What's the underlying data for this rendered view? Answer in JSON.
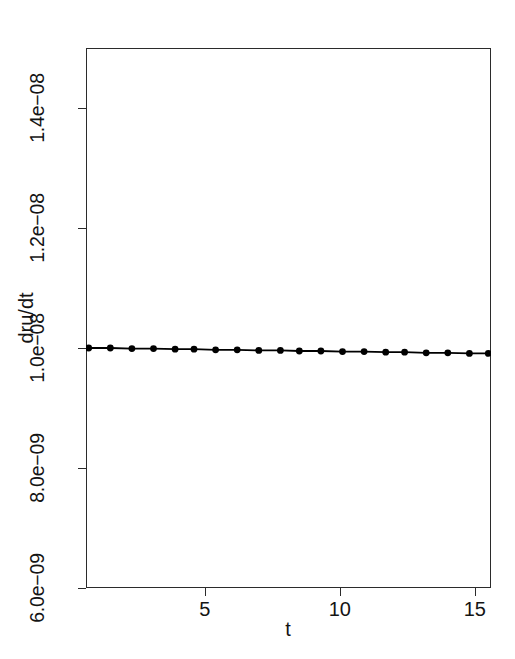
{
  "chart_data": {
    "type": "line",
    "title": "",
    "subtitle": "",
    "xlabel": "t",
    "ylabel": "dru/dt",
    "xlim": [
      0.6,
      15.6
    ],
    "ylim": [
      6e-09,
      1.5e-08
    ],
    "grid": false,
    "legend": null,
    "series": [
      {
        "name": "dru/dt",
        "marker": "filled-circle",
        "line": "solid",
        "color": "#000000",
        "x": [
          0.7,
          1.5,
          2.3,
          3.1,
          3.9,
          4.6,
          5.4,
          6.2,
          7.0,
          7.8,
          8.5,
          9.3,
          10.1,
          10.9,
          11.7,
          12.4,
          13.2,
          14.0,
          14.8,
          15.5
        ],
        "y": [
          1e-08,
          1e-08,
          9.99e-09,
          9.99e-09,
          9.98e-09,
          9.98e-09,
          9.97e-09,
          9.97e-09,
          9.96e-09,
          9.96e-09,
          9.95e-09,
          9.95e-09,
          9.94e-09,
          9.94e-09,
          9.93e-09,
          9.93e-09,
          9.92e-09,
          9.92e-09,
          9.91e-09,
          9.91e-09
        ]
      }
    ],
    "x_ticks": [
      {
        "value": 5,
        "label": "5"
      },
      {
        "value": 10,
        "label": "10"
      },
      {
        "value": 15,
        "label": "15"
      }
    ],
    "y_ticks": [
      {
        "value": 1.4e-08,
        "label": "1.4e−08"
      },
      {
        "value": 1.2e-08,
        "label": "1.2e−08"
      },
      {
        "value": 1e-08,
        "label": "1.0e−08"
      },
      {
        "value": 8e-09,
        "label": "8.0e−09"
      },
      {
        "value": 6e-09,
        "label": "6.0e−09"
      }
    ],
    "style": {
      "background": "#ffffff",
      "frame_color": "#2b2b2b",
      "text_color": "#141414",
      "series_color": "#000000"
    }
  },
  "axis": {
    "x_title": "t",
    "y_title": "dru/dt"
  }
}
